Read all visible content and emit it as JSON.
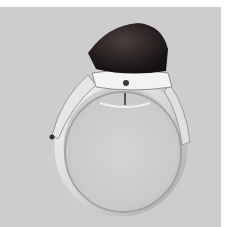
{
  "image": {
    "subject": "silver ring with dark cabochon stone",
    "style": "grayscale photograph",
    "colors": {
      "background": "#cdcdcd",
      "stone": "#2a2222",
      "metal_light": "#f2f2f2",
      "metal_shadow": "#9a9a9a"
    }
  }
}
